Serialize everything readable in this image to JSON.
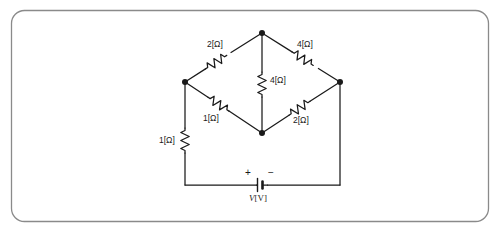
{
  "figure": {
    "kind": "circuit-schematic",
    "border": {
      "shape": "rounded-rectangle",
      "color": "#8a8a8a"
    },
    "line_color": "#1a1a1a",
    "background": "#ffffff"
  },
  "nodes": [
    {
      "id": "apex",
      "name": "top-node",
      "x": 262,
      "y": 33
    },
    {
      "id": "left",
      "name": "left-node",
      "x": 185,
      "y": 82
    },
    {
      "id": "right",
      "name": "right-node",
      "x": 340,
      "y": 82
    },
    {
      "id": "center",
      "name": "bottom-center-node",
      "x": 262,
      "y": 133
    }
  ],
  "components": {
    "r_top_left": {
      "label": "2[Ω]",
      "value": 2,
      "unit": "Ω",
      "orientation": "diagonal",
      "between": [
        "left",
        "apex"
      ]
    },
    "r_top_right": {
      "label": "4[Ω]",
      "value": 4,
      "unit": "Ω",
      "orientation": "diagonal",
      "between": [
        "apex",
        "right"
      ]
    },
    "r_middle": {
      "label": "4[Ω]",
      "value": 4,
      "unit": "Ω",
      "orientation": "vertical",
      "between": [
        "apex",
        "center"
      ]
    },
    "r_bottom_left": {
      "label": "1[Ω]",
      "value": 1,
      "unit": "Ω",
      "orientation": "diagonal",
      "between": [
        "left",
        "center"
      ]
    },
    "r_bottom_right": {
      "label": "2[Ω]",
      "value": 2,
      "unit": "Ω",
      "orientation": "diagonal",
      "between": [
        "center",
        "right"
      ]
    },
    "r_series": {
      "label": "1[Ω]",
      "value": 1,
      "unit": "Ω",
      "orientation": "vertical",
      "between": [
        "left",
        "bottom-left-corner"
      ]
    },
    "source": {
      "label": "V[V]",
      "symbol_name": "battery",
      "plus_sign": "+",
      "minus_sign": "−",
      "polarity": "plus-on-left"
    }
  },
  "labels": {
    "top_left": "2[Ω]",
    "top_right": "4[Ω]",
    "middle": "4[Ω]",
    "bottom_left": "1[Ω]",
    "bottom_right": "2[Ω]",
    "series_left": "1[Ω]",
    "source_v": "V",
    "source_unit": "[V]",
    "plus": "+",
    "minus": "−"
  }
}
